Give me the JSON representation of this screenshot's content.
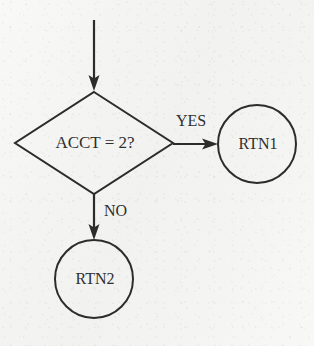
{
  "diagram": {
    "type": "flowchart",
    "background_color": "#f3f3f1",
    "line_color": "#2c2c2c",
    "text_color": "#2f2f2f",
    "nodes": [
      {
        "id": "decision",
        "shape": "diamond",
        "label": "ACCT = 2?",
        "cx": 94,
        "cy": 143,
        "half_width": 79,
        "half_height": 51,
        "font_size": 17
      },
      {
        "id": "rtn1",
        "shape": "circle",
        "label": "RTN1",
        "cx": 257,
        "cy": 144,
        "r": 39,
        "font_size": 16
      },
      {
        "id": "rtn2",
        "shape": "circle",
        "label": "RTN2",
        "cx": 94,
        "cy": 279,
        "r": 39,
        "font_size": 16
      }
    ],
    "edges": [
      {
        "id": "entry",
        "label": "",
        "from": "",
        "to": "decision",
        "orientation": "vertical",
        "x1": 94,
        "y1": 20,
        "x2": 94,
        "y2": 90
      },
      {
        "id": "yes-branch",
        "label": "YES",
        "from": "decision",
        "to": "rtn1",
        "orientation": "horizontal",
        "x1": 173,
        "y1": 144,
        "x2": 218,
        "y2": 144,
        "label_x": 176,
        "label_y": 126,
        "label_font_size": 16
      },
      {
        "id": "no-branch",
        "label": "NO",
        "from": "decision",
        "to": "rtn2",
        "orientation": "vertical",
        "x1": 94,
        "y1": 194,
        "x2": 94,
        "y2": 240,
        "label_x": 104,
        "label_y": 216,
        "label_font_size": 16
      }
    ]
  }
}
